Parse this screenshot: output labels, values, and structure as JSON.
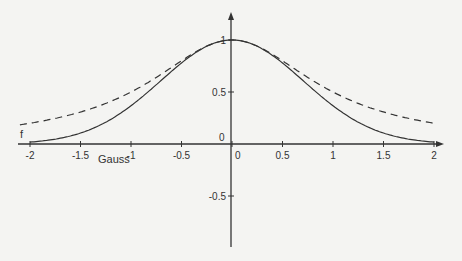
{
  "chart_data": {
    "type": "line",
    "title": "",
    "xlabel": "",
    "ylabel": "",
    "xlim": [
      -2.1,
      2.1
    ],
    "ylim": [
      -1.0,
      1.25
    ],
    "grid": false,
    "x_ticks": [
      "-2",
      "-1.5",
      "-1",
      "-0.5",
      "0",
      "0.5",
      "1",
      "1.5",
      "2"
    ],
    "y_ticks": [
      "-0.5",
      "0",
      "0.5",
      "1"
    ],
    "series": [
      {
        "name": "f",
        "style": "dashed",
        "formula": "1/(1+x^2)",
        "x": [
          -2,
          -1.5,
          -1,
          -0.5,
          0,
          0.5,
          1,
          1.5,
          2
        ],
        "values": [
          0.2,
          0.31,
          0.5,
          0.8,
          1.0,
          0.8,
          0.5,
          0.31,
          0.2
        ]
      },
      {
        "name": "Gauss",
        "style": "solid",
        "formula": "exp(-x^2)",
        "x": [
          -2,
          -1.5,
          -1,
          -0.5,
          0,
          0.5,
          1,
          1.5,
          2
        ],
        "values": [
          0.02,
          0.11,
          0.37,
          0.78,
          1.0,
          0.78,
          0.37,
          0.11,
          0.02
        ]
      }
    ],
    "annotations": [
      {
        "text": "f",
        "near": "dashed curve, left tail"
      },
      {
        "text": "Gauss",
        "near": "solid curve, left tail"
      }
    ]
  },
  "labels": {
    "f": "f",
    "gauss": "Gauss",
    "origin": "0"
  }
}
